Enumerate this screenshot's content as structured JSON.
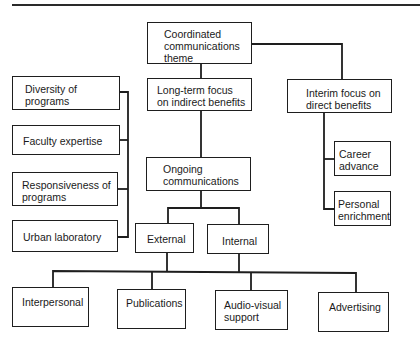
{
  "diagram": {
    "type": "hierarchy",
    "root": {
      "id": "theme",
      "label": "Coordinated communications theme",
      "lines": [
        "Coordinated",
        "communications",
        "theme"
      ]
    },
    "long_term": {
      "label": "Long-term focus on indirect benefits",
      "lines": [
        "Long-term focus",
        "on indirect benefits"
      ]
    },
    "interim": {
      "label": "Interim focus on direct benefits",
      "lines": [
        "Interim focus on",
        "direct benefits"
      ],
      "children": [
        {
          "label": "Career advance",
          "lines": [
            "Career",
            "advance"
          ]
        },
        {
          "label": "Personal enrichment",
          "lines": [
            "Personal",
            "enrichment"
          ]
        }
      ]
    },
    "strengths": [
      {
        "label": "Diversity of programs",
        "lines": [
          "Diversity of",
          "programs"
        ]
      },
      {
        "label": "Faculty expertise",
        "lines": [
          "Faculty expertise"
        ]
      },
      {
        "label": "Responsiveness of programs",
        "lines": [
          "Responsiveness of",
          "programs"
        ]
      },
      {
        "label": "Urban laboratory",
        "lines": [
          "Urban laboratory"
        ]
      }
    ],
    "ongoing": {
      "label": "Ongoing communications",
      "lines": [
        "Ongoing",
        "communications"
      ]
    },
    "audiences": [
      {
        "label": "External"
      },
      {
        "label": "Internal"
      }
    ],
    "channels": [
      {
        "label": "Interpersonal",
        "lines": [
          "Interpersonal"
        ]
      },
      {
        "label": "Publications",
        "lines": [
          "Publications"
        ]
      },
      {
        "label": "Audio-visual support",
        "lines": [
          "Audio-visual",
          "support"
        ]
      },
      {
        "label": "Advertising",
        "lines": [
          "Advertising"
        ]
      }
    ],
    "line_color": "#1e1e1e"
  }
}
